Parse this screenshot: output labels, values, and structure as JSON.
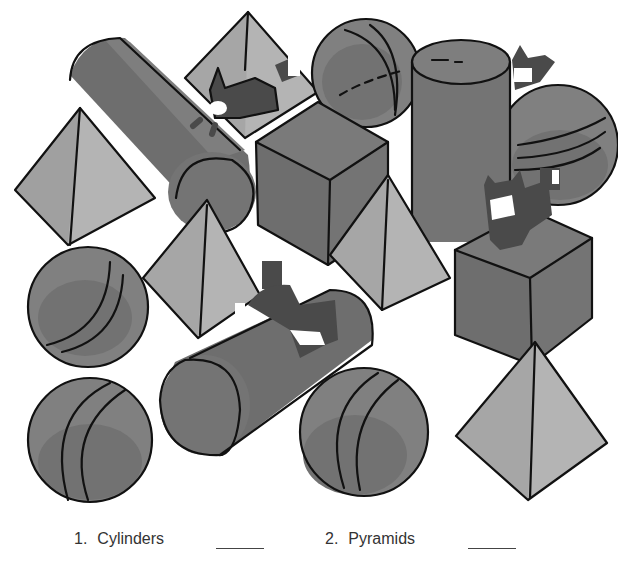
{
  "worksheet": {
    "questions": [
      {
        "number": "1.",
        "label": "Cylinders",
        "answer": ""
      },
      {
        "number": "2.",
        "label": "Pyramids",
        "answer": ""
      }
    ]
  },
  "colors": {
    "dark": "#6e6e6e",
    "mid": "#808080",
    "light": "#a6a6a6",
    "lighter": "#b4b4b4",
    "outline": "#111111",
    "cat": "#4a4a4a"
  },
  "scene": {
    "shapes": [
      {
        "type": "cylinder",
        "position": "top-left diagonal"
      },
      {
        "type": "cylinder",
        "position": "top-right upright"
      },
      {
        "type": "cylinder",
        "position": "center horizontal"
      },
      {
        "type": "pyramid",
        "position": "top center"
      },
      {
        "type": "pyramid",
        "position": "left"
      },
      {
        "type": "pyramid",
        "position": "center-left"
      },
      {
        "type": "pyramid",
        "position": "center"
      },
      {
        "type": "pyramid",
        "position": "bottom right"
      },
      {
        "type": "sphere",
        "position": "top center"
      },
      {
        "type": "sphere",
        "position": "right"
      },
      {
        "type": "sphere",
        "position": "left middle"
      },
      {
        "type": "sphere",
        "position": "left bottom"
      },
      {
        "type": "sphere",
        "position": "center bottom"
      },
      {
        "type": "cube",
        "position": "center"
      },
      {
        "type": "cube",
        "position": "right"
      }
    ],
    "cats": 4
  }
}
